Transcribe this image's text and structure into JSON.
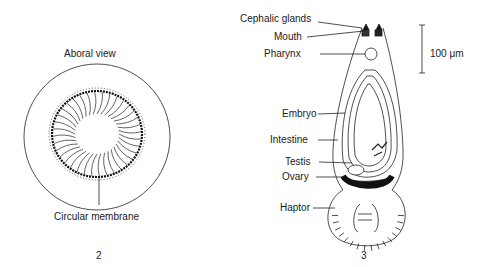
{
  "figure2": {
    "number": "2",
    "title": "Aboral view",
    "labels": {
      "circular_membrane": "Circular membrane"
    }
  },
  "figure3": {
    "number": "3",
    "labels": {
      "cephalic_glands": "Cephalic glands",
      "mouth": "Mouth",
      "pharynx": "Pharynx",
      "embryo": "Embryo",
      "intestine": "Intestine",
      "testis": "Testis",
      "ovary": "Ovary",
      "haptor": "Haptor"
    },
    "scale_bar": {
      "label": "100 μm"
    }
  }
}
